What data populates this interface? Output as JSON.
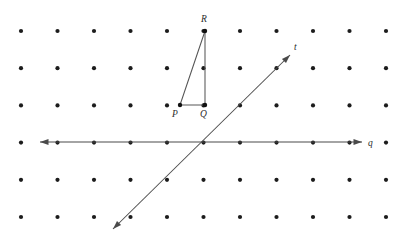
{
  "figure": {
    "width": 407,
    "height": 243,
    "background_color": "#ffffff",
    "dot_color": "#1c1c1c",
    "line_color": "#4a4a4a",
    "label_color": "#2b2b2b"
  },
  "grid": {
    "columns": 11,
    "rows": 6,
    "origin_x": 21,
    "origin_y": 31,
    "spacing_x": 36.5,
    "spacing_y": 37.2,
    "dot_radius": 2.1
  },
  "points": [
    {
      "name": "P",
      "label": "P",
      "x": 180,
      "y": 105,
      "label_x": 172,
      "label_y": 117
    },
    {
      "name": "Q",
      "label": "Q",
      "x": 205,
      "y": 105,
      "label_x": 200,
      "label_y": 117
    },
    {
      "name": "R",
      "label": "R",
      "x": 205,
      "y": 31,
      "label_x": 201,
      "label_y": 22
    }
  ],
  "triangle": {
    "name": "triangle-PQR",
    "vertices": [
      "P",
      "Q",
      "R"
    ],
    "edges": [
      {
        "name": "edge-PQ",
        "from": "P",
        "to": "Q"
      },
      {
        "name": "edge-QR",
        "from": "Q",
        "to": "R"
      },
      {
        "name": "edge-RP",
        "from": "R",
        "to": "P"
      }
    ]
  },
  "lines": [
    {
      "name": "line-q",
      "label": "q",
      "orientation": "horizontal",
      "x1": 40,
      "y1": 142,
      "x2": 362,
      "y2": 142,
      "label_x": 368,
      "label_y": 146,
      "arrows": "both"
    },
    {
      "name": "line-t",
      "label": "t",
      "orientation": "diagonal",
      "x1": 113,
      "y1": 229,
      "x2": 290,
      "y2": 55,
      "label_x": 294,
      "label_y": 50,
      "arrows": "both"
    }
  ],
  "intersection": {
    "name": "lines-intersection",
    "x": 205,
    "y": 142
  }
}
